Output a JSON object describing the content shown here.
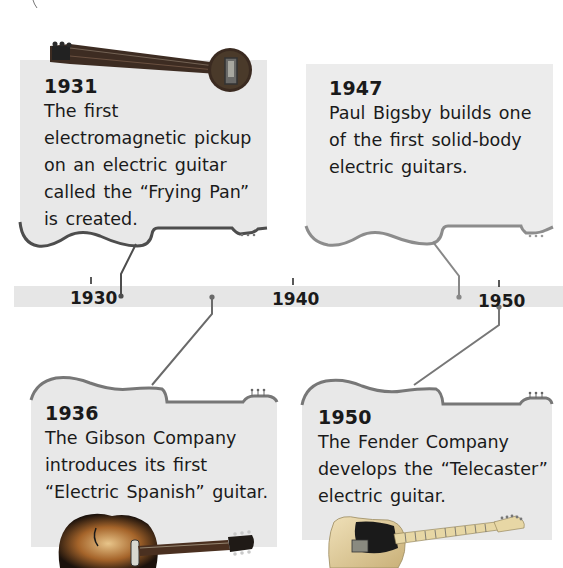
{
  "timeline": {
    "axis_labels": [
      "1930",
      "1940",
      "1950"
    ],
    "bar_color": "#e6e6e6",
    "line_color": "#7a7a7a"
  },
  "events": [
    {
      "year": "1931",
      "description": "The first electromagnetic pickup on an electric guitar called the “Frying Pan” is created.",
      "image": "frying-pan-lap-steel-guitar",
      "position": "top-left"
    },
    {
      "year": "1947",
      "description": "Paul Bigsby builds one of the first solid-body electric guitars.",
      "image": "none",
      "position": "top-right"
    },
    {
      "year": "1936",
      "description": "The Gibson Company introduces its first “Electric Spanish” guitar.",
      "image": "gibson-archtop-sunburst-guitar",
      "position": "bottom-left"
    },
    {
      "year": "1950",
      "description": "The Fender Company develops the “Telecaster” electric guitar.",
      "image": "fender-telecaster-guitar",
      "position": "bottom-right"
    }
  ]
}
